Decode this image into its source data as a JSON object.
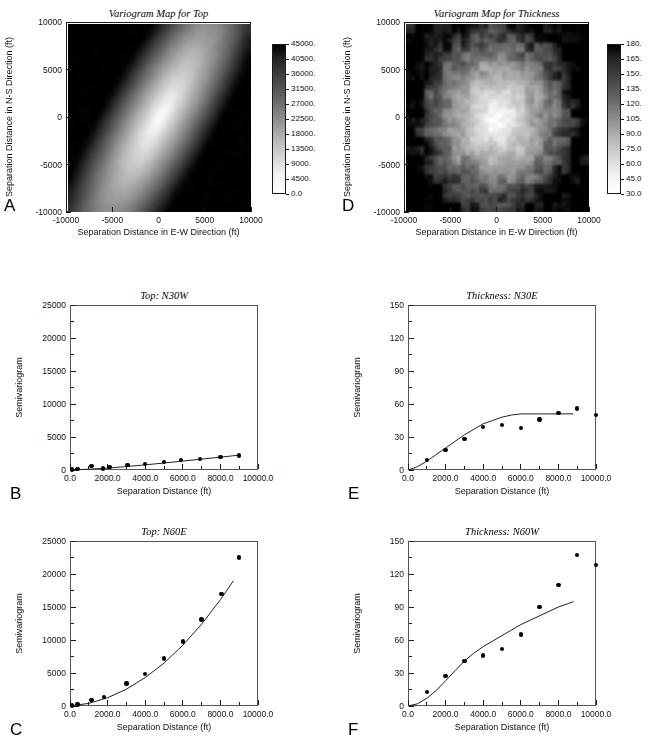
{
  "figure": {
    "panel_letters": [
      "A",
      "B",
      "C",
      "D",
      "E",
      "F"
    ],
    "axis_titles": {
      "map_x": "Separation Distance in E-W Direction (ft)",
      "map_y": "Separation Distance in N-S Direction (ft)",
      "vario_x": "Separation Distance (ft)",
      "vario_y": "Semivariogram"
    }
  },
  "chart_data": [
    {
      "panel": "A",
      "type": "heatmap",
      "title": "Variogram Map for Top",
      "xlabel": "Separation Distance in E-W Direction (ft)",
      "ylabel": "Separation Distance in N-S Direction (ft)",
      "xlim": [
        -10000,
        10000
      ],
      "ylim": [
        -10000,
        10000
      ],
      "xticks": [
        "-10000",
        "-5000",
        "0",
        "5000",
        "10000"
      ],
      "yticks": [
        "10000",
        "5000",
        "0",
        "-5000",
        "-10000"
      ],
      "colorbar": {
        "min": 0.0,
        "max": 45000,
        "step": 4500,
        "labels": [
          "45000.",
          "40500.",
          "36000.",
          "31500.",
          "27000.",
          "22500.",
          "18000.",
          "13500.",
          "9000.",
          "4500.",
          "0.0"
        ],
        "scheme": "grayscale-inverted",
        "low_color": "#ffffff",
        "high_color": "#000000"
      },
      "pattern": "anisotropic NW-SE low-variance trough; dark high-variance lobes on E and W edges; major continuity axis approx N30W"
    },
    {
      "panel": "B",
      "type": "scatter",
      "title": "Top: N30W",
      "xlabel": "Separation Distance (ft)",
      "ylabel": "Semivariogram",
      "xlim": [
        0,
        10000
      ],
      "ylim": [
        0,
        25000
      ],
      "xticks": [
        "0.0",
        "2000.0",
        "4000.0",
        "6000.0",
        "8000.0",
        "10000.0"
      ],
      "yticks": [
        "0",
        "5000",
        "10000",
        "15000",
        "20000",
        "25000"
      ],
      "points": {
        "x": [
          100,
          400,
          1150,
          1750,
          2100,
          3050,
          4000,
          5000,
          5900,
          6900,
          8000,
          9000
        ],
        "y": [
          60,
          120,
          620,
          250,
          430,
          800,
          900,
          1250,
          1500,
          1650,
          2000,
          2200
        ]
      },
      "model": {
        "name": "fitted-model",
        "x": [
          0,
          1000,
          2000,
          3000,
          4000,
          5000,
          6000,
          7000,
          8000,
          9000
        ],
        "y": [
          20,
          120,
          290,
          520,
          780,
          1060,
          1350,
          1650,
          1950,
          2250
        ]
      }
    },
    {
      "panel": "C",
      "type": "scatter",
      "title": "Top: N60E",
      "xlabel": "Separation Distance (ft)",
      "ylabel": "Semivariogram",
      "xlim": [
        0,
        10000
      ],
      "ylim": [
        0,
        25000
      ],
      "xticks": [
        "0.0",
        "2000.0",
        "4000.0",
        "6000.0",
        "8000.0",
        "10000.0"
      ],
      "yticks": [
        "0",
        "5000",
        "10000",
        "15000",
        "20000",
        "25000"
      ],
      "points": {
        "x": [
          100,
          400,
          1150,
          1800,
          3000,
          4000,
          5000,
          6000,
          7000,
          8050,
          9000
        ],
        "y": [
          60,
          200,
          950,
          1400,
          3400,
          4850,
          7200,
          9800,
          13100,
          17000,
          22500
        ]
      },
      "model": {
        "name": "fitted-model",
        "x": [
          0,
          1000,
          2000,
          3000,
          4000,
          5000,
          6000,
          7000,
          8000,
          8700
        ],
        "y": [
          0,
          400,
          1250,
          2550,
          4300,
          6500,
          9200,
          12400,
          16100,
          19000
        ]
      }
    },
    {
      "panel": "D",
      "type": "heatmap",
      "title": "Variogram Map for Thickness",
      "xlabel": "Separation Distance in E-W Direction (ft)",
      "ylabel": "Separation Distance in N-S Direction (ft)",
      "xlim": [
        -10000,
        10000
      ],
      "ylim": [
        -10000,
        10000
      ],
      "xticks": [
        "-10000",
        "-5000",
        "0",
        "5000",
        "10000"
      ],
      "yticks": [
        "10000",
        "5000",
        "0",
        "-5000",
        "-10000"
      ],
      "colorbar": {
        "min": 30.0,
        "max": 180,
        "step": 15,
        "labels": [
          "180.",
          "165.",
          "150.",
          "135.",
          "120.",
          "105.",
          "90.0",
          "75.0",
          "60.0",
          "45.0",
          "30.0"
        ],
        "scheme": "grayscale-inverted",
        "low_color": "#ffffff",
        "high_color": "#000000"
      },
      "pattern": "bullseye with white low-variance core; noisy dark high-variance blocks on E and W margins; weak NE-SW elongation"
    },
    {
      "panel": "E",
      "type": "scatter",
      "title": "Thickness: N30E",
      "xlabel": "Separation Distance (ft)",
      "ylabel": "Semivariogram",
      "xlim": [
        0,
        10000
      ],
      "ylim": [
        0,
        150
      ],
      "xticks": [
        "0.0",
        "2000.0",
        "4000.0",
        "6000.0",
        "8000.0",
        "10000.0"
      ],
      "yticks": [
        "0",
        "30",
        "60",
        "90",
        "120",
        "150"
      ],
      "points": {
        "x": [
          1000,
          2000,
          3000,
          4000,
          5000,
          6000,
          7000,
          8000,
          9000,
          10000
        ],
        "y": [
          9,
          18,
          28,
          39,
          41,
          38,
          46,
          52,
          56,
          50
        ]
      },
      "model": {
        "name": "spherical-model",
        "sill": 51,
        "range": 6500,
        "x": [
          0,
          500,
          1000,
          1500,
          2000,
          2500,
          3000,
          3500,
          4000,
          4500,
          5000,
          5500,
          6000,
          6500,
          7000,
          7500,
          8000,
          8800
        ],
        "y": [
          0,
          3,
          8,
          14,
          20,
          26,
          32,
          37,
          42,
          45,
          48,
          50,
          51,
          51,
          51,
          51,
          51,
          51
        ]
      }
    },
    {
      "panel": "F",
      "type": "scatter",
      "title": "Thickness: N60W",
      "xlabel": "Separation Distance (ft)",
      "ylabel": "Semivariogram",
      "xlim": [
        0,
        10000
      ],
      "ylim": [
        0,
        150
      ],
      "xticks": [
        "0.0",
        "2000.0",
        "4000.0",
        "6000.0",
        "8000.0",
        "10000.0"
      ],
      "yticks": [
        "0",
        "30",
        "60",
        "90",
        "120",
        "150"
      ],
      "points": {
        "x": [
          1000,
          2000,
          3000,
          4000,
          5000,
          6000,
          7000,
          8000,
          9000,
          10000
        ],
        "y": [
          13,
          27,
          41,
          46,
          52,
          65,
          90,
          110,
          137,
          128
        ]
      },
      "model": {
        "name": "fitted-model",
        "x": [
          0,
          500,
          1000,
          1500,
          2000,
          2500,
          3000,
          3500,
          4000,
          4500,
          5000,
          5500,
          6000,
          6500,
          7000,
          7500,
          8000,
          8500,
          8800
        ],
        "y": [
          0,
          2,
          7,
          14,
          23,
          32,
          41,
          48,
          54,
          59,
          64,
          69,
          74,
          78,
          82,
          86,
          90,
          93,
          95
        ]
      }
    }
  ]
}
